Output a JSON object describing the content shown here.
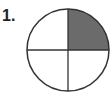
{
  "problem": {
    "number_label": "1."
  },
  "figure": {
    "shape": "circle",
    "parts": 4,
    "shaded_parts": 1,
    "shaded_quadrant": "top-right",
    "fill_color": "#6b6b6b",
    "stroke_color": "#333333"
  }
}
